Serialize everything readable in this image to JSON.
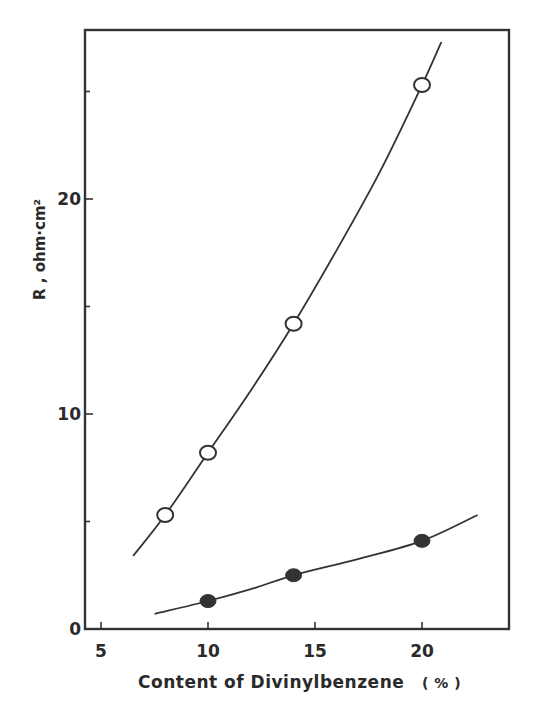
{
  "chart_data": {
    "type": "line",
    "title": "",
    "xlabel": "Content of Divinylbenzene",
    "xlabel_unit": "( % )",
    "ylabel": "R , ohm·cm²",
    "xlim": [
      4.2,
      22.9
    ],
    "ylim": [
      0,
      27.9
    ],
    "x_ticks": [
      5,
      10,
      15,
      20
    ],
    "x_tick_labels": [
      "5",
      "10",
      "15",
      "20"
    ],
    "y_ticks_major": [
      0,
      10,
      20
    ],
    "y_tick_labels": [
      "0",
      "10",
      "20"
    ],
    "y_ticks_minor": [
      5,
      15,
      25
    ],
    "grid": false,
    "legend": null,
    "series": [
      {
        "name": "open circles",
        "marker": "open-circle",
        "points": [
          {
            "x": 8,
            "y": 5.3
          },
          {
            "x": 10,
            "y": 8.2
          },
          {
            "x": 14,
            "y": 14.2
          },
          {
            "x": 20,
            "y": 25.3
          }
        ],
        "fit_curve": [
          {
            "x": 6.5,
            "y": 3.4
          },
          {
            "x": 8,
            "y": 5.3
          },
          {
            "x": 10,
            "y": 8.2
          },
          {
            "x": 12,
            "y": 11.1
          },
          {
            "x": 14,
            "y": 14.2
          },
          {
            "x": 16,
            "y": 17.6
          },
          {
            "x": 18,
            "y": 21.2
          },
          {
            "x": 20,
            "y": 25.3
          },
          {
            "x": 20.9,
            "y": 27.3
          }
        ]
      },
      {
        "name": "filled circles",
        "marker": "filled-circle",
        "points": [
          {
            "x": 10,
            "y": 1.3
          },
          {
            "x": 14,
            "y": 2.5
          },
          {
            "x": 20,
            "y": 4.1
          }
        ],
        "fit_curve": [
          {
            "x": 7.5,
            "y": 0.7
          },
          {
            "x": 10,
            "y": 1.3
          },
          {
            "x": 12,
            "y": 1.85
          },
          {
            "x": 14,
            "y": 2.5
          },
          {
            "x": 17,
            "y": 3.25
          },
          {
            "x": 20,
            "y": 4.1
          },
          {
            "x": 22.6,
            "y": 5.3
          }
        ]
      }
    ]
  },
  "layout": {
    "plot": {
      "left": 85,
      "top": 30,
      "right": 509,
      "bottom": 629
    },
    "x_px": {
      "origin_value": 5,
      "origin_px": 101,
      "px_per_unit": 21.4
    },
    "y_px": {
      "origin_value": 0,
      "origin_px": 629,
      "px_per_unit": 21.5
    }
  }
}
